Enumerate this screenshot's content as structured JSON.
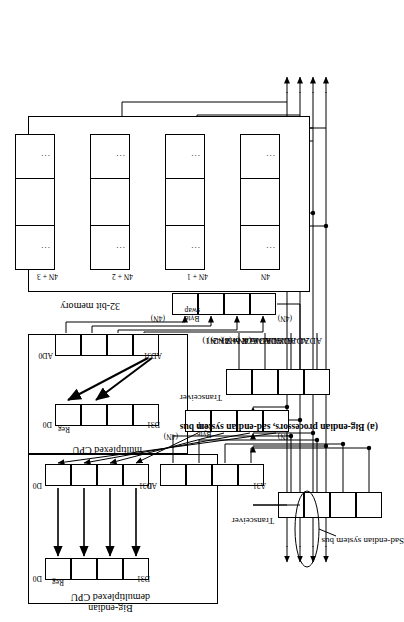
{
  "figure": {
    "caption": "(a) Big-endian processors, sad-endian system bus",
    "bus_annotation": "Sad-endian system bus"
  },
  "memory": {
    "title": "32-bit memory",
    "words": [
      {
        "address": "4N",
        "left_cell": "...",
        "right_cell": "..."
      },
      {
        "address": "4N + 1",
        "left_cell": "...",
        "right_cell": "..."
      },
      {
        "address": "4N + 2",
        "left_cell": "...",
        "right_cell": "..."
      },
      {
        "address": "4N + 3",
        "left_cell": "...",
        "right_cell": "..."
      }
    ]
  },
  "cpu_demux": {
    "title_line1": "Big-endian",
    "title_line2": "demultiplexed CPU",
    "register_label": "Reg",
    "reg_top_bit": "D0",
    "reg_bottom_bit": "D31",
    "data_port_top": "D0",
    "data_port_bottom": "D31",
    "addr_port_top": "A0",
    "addr_port_bottom": "A31",
    "byte_swap_line1": "Byte",
    "byte_swap_line2": "swap",
    "swap_tag_left": "(4N)",
    "swap_tag_right": "(4N)",
    "transceiver_label": "Transceiver"
  },
  "cpu_mux": {
    "title_line1": "Big-endian",
    "title_line2": "multiplexed CPU",
    "register_label": "Reg",
    "reg_top_bit": "D0",
    "reg_bottom_bit": "D31",
    "ad_port_top": "AD0",
    "ad_port_bottom": "AD31",
    "byte_swap_line1": "Byte",
    "byte_swap_line2": "swap",
    "swap_tag_left": "(4N)",
    "swap_tag_right": "(4N)",
    "transceiver_label": "Transceiver"
  },
  "bus_lines": [
    "AD0 – AD7 or Z (4N)",
    "AD8 – AD15 or Y (4N + 1)",
    "AD16 – AD23 or X (4N + 2)",
    "AD24 – AD31 or W (4N + 3)"
  ]
}
